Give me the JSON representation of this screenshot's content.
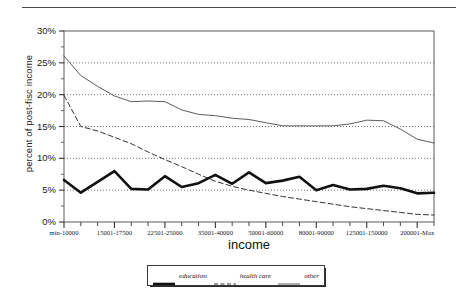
{
  "chart_data": {
    "type": "line",
    "title": "",
    "xlabel": "income",
    "ylabel": "percent of post-fisc income",
    "ylim": [
      0,
      30
    ],
    "yticks": [
      "0%",
      "5%",
      "10%",
      "15%",
      "20%",
      "25%",
      "30%"
    ],
    "ytick_values": [
      0,
      5,
      10,
      15,
      20,
      25,
      30
    ],
    "grid": true,
    "legend_position": "bottom",
    "x_labeled_ticks": [
      "min-10000",
      "15001-17500",
      "22501-25000",
      "35001-40000",
      "50001-60000",
      "80001-90000",
      "125001-150000",
      "200001-Max"
    ],
    "x_labeled_tick_indices": [
      0,
      3,
      6,
      9,
      12,
      15,
      18,
      21
    ],
    "n_points": 23,
    "series": [
      {
        "name": "education",
        "style": "thick-solid",
        "color": "#111111",
        "values": [
          6.6,
          4.6,
          6.3,
          8.0,
          5.2,
          5.1,
          7.2,
          5.5,
          6.1,
          7.4,
          6.0,
          7.8,
          6.1,
          6.5,
          7.1,
          5.0,
          5.8,
          5.1,
          5.2,
          5.7,
          5.3,
          4.5,
          4.6
        ]
      },
      {
        "name": "health care",
        "style": "dashed",
        "color": "#333333",
        "values": [
          19.9,
          15.0,
          14.3,
          13.3,
          12.3,
          11.0,
          9.8,
          8.7,
          7.5,
          6.4,
          5.6,
          5.0,
          4.5,
          4.0,
          3.6,
          3.2,
          2.8,
          2.4,
          2.1,
          1.8,
          1.5,
          1.2,
          1.1
        ]
      },
      {
        "name": "other",
        "style": "thin-solid",
        "color": "#4a4a4a",
        "values": [
          26.1,
          23.0,
          21.3,
          19.8,
          18.9,
          19.0,
          18.9,
          17.6,
          16.9,
          16.7,
          16.3,
          16.1,
          15.6,
          15.1,
          15.1,
          15.1,
          15.1,
          15.4,
          16.0,
          15.9,
          14.6,
          13.0,
          12.4
        ]
      }
    ]
  },
  "legend": {
    "items": [
      {
        "label": "education"
      },
      {
        "label": "health care"
      },
      {
        "label": "other"
      }
    ]
  }
}
